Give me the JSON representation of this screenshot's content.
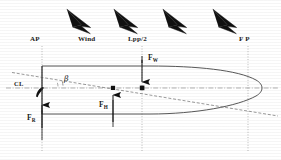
{
  "figure": {
    "background_color": "#ffffff",
    "ink_color": "#1a1a1a",
    "width": 281,
    "height": 160
  },
  "top_labels": [
    {
      "id": "ap",
      "text": "AP",
      "x": 30,
      "y": 41
    },
    {
      "id": "wind",
      "text": "Wind",
      "x": 79,
      "y": 41
    },
    {
      "id": "lpp2",
      "text": "Lpp/2",
      "x": 130,
      "y": 41
    },
    {
      "id": "fp",
      "text": "F P",
      "x": 240,
      "y": 41
    }
  ],
  "force_labels": [
    {
      "id": "fw",
      "base": "F",
      "sub": "W",
      "x": 148,
      "y": 60
    },
    {
      "id": "fh",
      "base": "F",
      "sub": "H",
      "x": 104,
      "y": 104
    },
    {
      "id": "fr",
      "base": "F",
      "sub": "R",
      "x": 29,
      "y": 116
    }
  ],
  "axis_labels": [
    {
      "id": "cl",
      "text": "CL",
      "x": 17,
      "y": 85
    },
    {
      "id": "beta",
      "text": "β",
      "x": 66,
      "y": 81
    }
  ],
  "wind_arrows": {
    "count": 4,
    "direction": "down-right",
    "fill_color": "#111111",
    "positions": [
      {
        "x": 80,
        "y": 22
      },
      {
        "x": 124,
        "y": 22
      },
      {
        "x": 173,
        "y": 22
      },
      {
        "x": 222,
        "y": 22
      }
    ]
  },
  "reference_lines": [
    {
      "id": "ap-vertical",
      "x": 42,
      "y1": 46,
      "y2": 150,
      "style": "dotted"
    },
    {
      "id": "lpp2-vertical",
      "x": 142,
      "y1": 46,
      "y2": 150,
      "style": "dotted"
    },
    {
      "id": "fp-vertical",
      "x": 248,
      "y1": 46,
      "y2": 150,
      "style": "dotted"
    },
    {
      "id": "centerline",
      "x1": 8,
      "x2": 276,
      "y": 88,
      "style": "dash-dot"
    },
    {
      "id": "drift-axis",
      "x1": 14,
      "x2": 276,
      "y1": 74,
      "y2": 112,
      "style": "dashed"
    }
  ],
  "hull": {
    "description": "Ship hull plan view, transom stern at left, rounded bow at right",
    "stern_x": 42,
    "bow_x": 262,
    "top_y": 66,
    "bottom_y": 114,
    "line_color": "#3a3a3a"
  },
  "force_vectors": [
    {
      "id": "wind-force",
      "label": "F_W",
      "direction": "down",
      "x": 142,
      "tail_y": 60,
      "head_y": 88,
      "marker": "square"
    },
    {
      "id": "hydrodynamic-force",
      "label": "F_H",
      "direction": "up",
      "x": 113,
      "tail_y": 120,
      "head_y": 90,
      "marker": "square"
    },
    {
      "id": "rudder-force",
      "label": "F_R",
      "direction": "up",
      "x": 42,
      "tail_y": 142,
      "head_y": 108,
      "marker": "none"
    }
  ],
  "markers": [
    {
      "id": "cl-marker",
      "x": 40,
      "y": 88,
      "shape": "teardrop"
    },
    {
      "id": "fh-marker",
      "x": 113,
      "y": 88,
      "shape": "square"
    },
    {
      "id": "fw-marker",
      "x": 142,
      "y": 88,
      "shape": "square"
    }
  ],
  "angle_arc": {
    "id": "drift-angle",
    "symbol": "β",
    "vertex_x": 42,
    "vertex_y": 82,
    "radius": 22
  }
}
